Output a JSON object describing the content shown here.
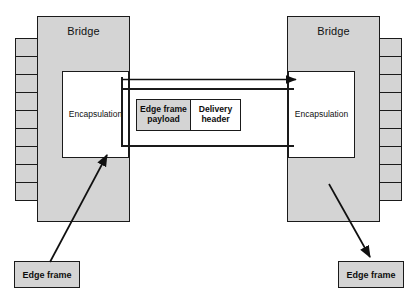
{
  "diagram": {
    "colors": {
      "shade": "#d4d4d4",
      "stroke": "#1a1a1a",
      "background": "#ffffff"
    },
    "left_bridge": {
      "label": "Bridge",
      "encapsulation_label": "Encapsulation",
      "port_cell_count": 9
    },
    "right_bridge": {
      "label": "Bridge",
      "encapsulation_label": "Encapsulation",
      "port_cell_count": 9
    },
    "packet": {
      "fields": [
        {
          "label": "Edge frame payload",
          "shaded": true
        },
        {
          "label": "Delivery header",
          "shaded": false
        }
      ]
    },
    "bottom_left_box": {
      "label": "Edge frame"
    },
    "bottom_right_box": {
      "label": "Edge frame"
    },
    "flow_arrow": {
      "direction": "left-to-right"
    },
    "ingress_arrow": {
      "direction": "up-right"
    },
    "egress_arrow": {
      "direction": "down-right"
    }
  }
}
